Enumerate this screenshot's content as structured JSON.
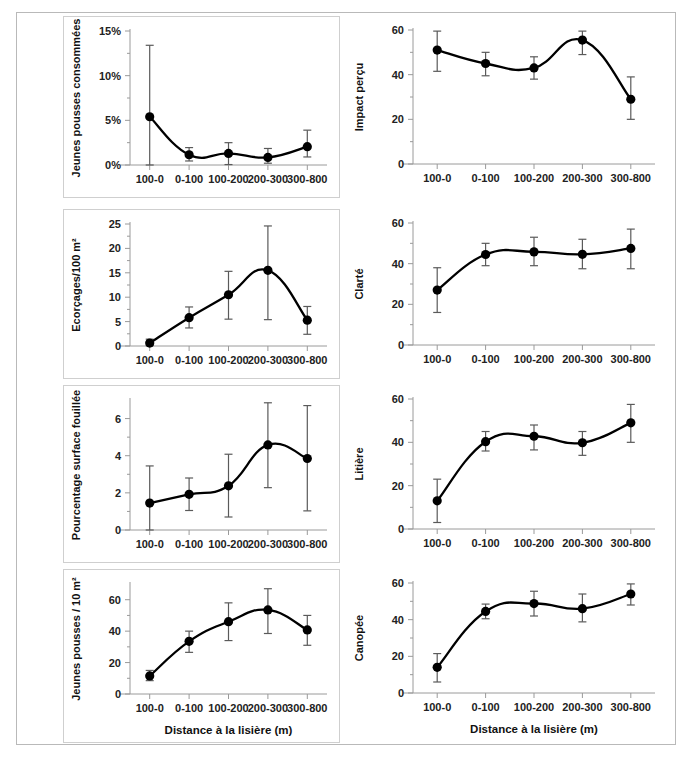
{
  "figure": {
    "caption": "",
    "x_axis_label": "Distance à la lisière (m)",
    "categories": [
      "100-0",
      "0-100",
      "100-200",
      "200-300",
      "300-800"
    ],
    "marker_color": "#000000",
    "line_color": "#000000",
    "errorbar_color": "#5a5a5a",
    "axis_color": "#9a9a9a",
    "panel_border_color": "#cfcfcf",
    "frame_border_color": "#b9b9b9"
  },
  "chart_data": [
    {
      "type": "line",
      "panel_id": "jeunes-pousses-consommees",
      "position": "row1-left",
      "boxed": true,
      "title": "",
      "ylabel": "Jeunes pousses consommées",
      "xlabel": "",
      "categories": [
        "100-0",
        "0-100",
        "100-200",
        "200-300",
        "300-800"
      ],
      "values": [
        5.4,
        1.15,
        1.3,
        0.85,
        2.05
      ],
      "err_low": [
        0.0,
        0.45,
        0.05,
        0.2,
        0.9
      ],
      "err_high": [
        13.4,
        1.95,
        2.5,
        1.85,
        3.9
      ],
      "ylim": [
        0,
        15
      ],
      "yticks": [
        0,
        5,
        10,
        15
      ],
      "ytick_labels": [
        "0%",
        "5%",
        "10%",
        "15%"
      ],
      "minor_ticks": true,
      "grid": false,
      "legend": "none"
    },
    {
      "type": "line",
      "panel_id": "impact-percu",
      "position": "row1-right",
      "boxed": false,
      "title": "",
      "ylabel": "Impact perçu",
      "xlabel": "",
      "categories": [
        "100-0",
        "0-100",
        "100-200",
        "200-300",
        "300-800"
      ],
      "values": [
        51,
        45,
        43,
        55.5,
        29
      ],
      "err_low": [
        41.5,
        39.5,
        38,
        49,
        20
      ],
      "err_high": [
        59.5,
        50,
        48,
        59.5,
        39
      ],
      "ylim": [
        0,
        60
      ],
      "yticks": [
        0,
        20,
        40,
        60
      ],
      "ytick_labels": [
        "0",
        "20",
        "40",
        "60"
      ],
      "minor_ticks": true,
      "grid": false,
      "legend": "none"
    },
    {
      "type": "line",
      "panel_id": "ecorcages-100m2",
      "position": "row2-left",
      "boxed": true,
      "title": "",
      "ylabel": "Ecorçages/100 m²",
      "xlabel": "",
      "categories": [
        "100-0",
        "0-100",
        "100-200",
        "200-300",
        "300-800"
      ],
      "values": [
        0.6,
        5.8,
        10.5,
        15.5,
        5.3
      ],
      "err_low": [
        0.1,
        3.7,
        5.5,
        5.4,
        2.4
      ],
      "err_high": [
        1.4,
        8.0,
        15.3,
        24.6,
        8.1
      ],
      "ylim": [
        0,
        25
      ],
      "yticks": [
        0,
        5,
        10,
        15,
        20,
        25
      ],
      "ytick_labels": [
        "0",
        "5",
        "10",
        "15",
        "20",
        "25"
      ],
      "minor_ticks": true,
      "grid": false,
      "legend": "none"
    },
    {
      "type": "line",
      "panel_id": "clarte",
      "position": "row2-right",
      "boxed": false,
      "title": "",
      "ylabel": "Clarté",
      "xlabel": "",
      "categories": [
        "100-0",
        "0-100",
        "100-200",
        "200-300",
        "300-800"
      ],
      "values": [
        27,
        44.5,
        45.8,
        44.6,
        47.5
      ],
      "err_low": [
        16,
        39,
        39,
        37.5,
        37.5
      ],
      "err_high": [
        38,
        50,
        53,
        52,
        57
      ],
      "ylim": [
        0,
        60
      ],
      "yticks": [
        0,
        20,
        40,
        60
      ],
      "ytick_labels": [
        "0",
        "20",
        "40",
        "60"
      ],
      "minor_ticks": true,
      "grid": false,
      "legend": "none"
    },
    {
      "type": "line",
      "panel_id": "pourcentage-surface-fouillee",
      "position": "row3-left",
      "boxed": true,
      "title": "",
      "ylabel": "Pourcentage surface fouillée",
      "xlabel": "",
      "categories": [
        "100-0",
        "0-100",
        "100-200",
        "200-300",
        "300-800"
      ],
      "values": [
        1.45,
        1.92,
        2.38,
        4.58,
        3.85
      ],
      "err_low": [
        0.0,
        1.05,
        0.7,
        2.28,
        1.03
      ],
      "err_high": [
        3.45,
        2.8,
        4.08,
        6.85,
        6.7
      ],
      "ylim": [
        0,
        7
      ],
      "yticks": [
        0,
        2,
        4,
        6
      ],
      "ytick_labels": [
        "0",
        "2",
        "4",
        "6"
      ],
      "minor_ticks": true,
      "grid": false,
      "legend": "none"
    },
    {
      "type": "line",
      "panel_id": "litiere",
      "position": "row3-right",
      "boxed": false,
      "title": "",
      "ylabel": "Litière",
      "xlabel": "",
      "categories": [
        "100-0",
        "0-100",
        "100-200",
        "200-300",
        "300-800"
      ],
      "values": [
        13,
        40.3,
        42.8,
        39.8,
        49
      ],
      "err_low": [
        3,
        36,
        36.5,
        34,
        40
      ],
      "err_high": [
        23,
        45,
        48,
        45,
        57.5
      ],
      "ylim": [
        0,
        60
      ],
      "yticks": [
        0,
        20,
        40,
        60
      ],
      "ytick_labels": [
        "0",
        "20",
        "40",
        "60"
      ],
      "minor_ticks": true,
      "grid": false,
      "legend": "none"
    },
    {
      "type": "line",
      "panel_id": "jeunes-pousses-10m2",
      "position": "row4-left",
      "boxed": true,
      "title": "",
      "ylabel": "Jeunes pousses / 10 m²",
      "xlabel": "Distance à la lisière (m)",
      "categories": [
        "100-0",
        "0-100",
        "100-200",
        "200-300",
        "300-800"
      ],
      "values": [
        11.5,
        33.5,
        46,
        53.5,
        40.8
      ],
      "err_low": [
        8.5,
        26.5,
        34,
        38.5,
        31
      ],
      "err_high": [
        15,
        40,
        58,
        67,
        50
      ],
      "ylim": [
        0,
        70
      ],
      "yticks": [
        0,
        20,
        40,
        60
      ],
      "ytick_labels": [
        "0",
        "20",
        "40",
        "60"
      ],
      "minor_ticks": true,
      "grid": false,
      "legend": "none"
    },
    {
      "type": "line",
      "panel_id": "canopee",
      "position": "row4-right",
      "boxed": false,
      "title": "",
      "ylabel": "Canopée",
      "xlabel": "Distance à la lisière (m)",
      "categories": [
        "100-0",
        "0-100",
        "100-200",
        "200-300",
        "300-800"
      ],
      "values": [
        14,
        44.5,
        48.8,
        46,
        54
      ],
      "err_low": [
        6,
        40.5,
        42,
        38.8,
        48
      ],
      "err_high": [
        21.5,
        48.5,
        55.5,
        54,
        59.5
      ],
      "ylim": [
        0,
        60
      ],
      "yticks": [
        0,
        20,
        40,
        60
      ],
      "ytick_labels": [
        "0",
        "20",
        "40",
        "60"
      ],
      "minor_ticks": true,
      "grid": false,
      "legend": "none"
    }
  ]
}
